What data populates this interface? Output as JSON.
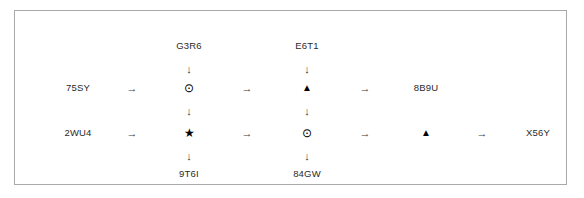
{
  "diagram": {
    "type": "flow-grid",
    "border_color": "#a9a9ad",
    "background": "#ffffff",
    "text_color": "#2a2a2a",
    "glyphs": {
      "arrow_right": "→",
      "arrow_down": "↓",
      "circled_dot": "⊙",
      "triangle_up": "▲",
      "star": "★"
    },
    "columns": {
      "col1_x": 63,
      "col2_x": 117,
      "col3_x": 174,
      "col4_x": 232,
      "col5_x": 292,
      "col6_x": 350,
      "col7_x": 411,
      "col8_x": 467,
      "col9_x": 523
    },
    "rows": {
      "top_label_y": 35,
      "top_arrow_y": 58,
      "row1_y": 77,
      "mid_arrow_y": 100,
      "row2_y": 122,
      "bottom_arrow_y": 145,
      "bottom_label_y": 163
    },
    "top_labels": [
      {
        "text": "G3R6",
        "col": "col3_x"
      },
      {
        "text": "E6T1",
        "col": "col5_x"
      }
    ],
    "bottom_labels": [
      {
        "text": "9T6I",
        "col": "col3_x"
      },
      {
        "text": "84GW",
        "col": "col5_x"
      }
    ],
    "row1": {
      "items": [
        {
          "kind": "label",
          "text": "75SY",
          "col": "col1_x"
        },
        {
          "kind": "arrow-right",
          "text": "→",
          "col": "col2_x"
        },
        {
          "kind": "node-circledot",
          "text": "⊙",
          "col": "col3_x"
        },
        {
          "kind": "arrow-right",
          "text": "→",
          "col": "col4_x"
        },
        {
          "kind": "node-triangle",
          "text": "▲",
          "col": "col5_x"
        },
        {
          "kind": "arrow-right",
          "text": "→",
          "col": "col6_x"
        },
        {
          "kind": "label",
          "text": "8B9U",
          "col": "col7_x"
        }
      ]
    },
    "row2": {
      "items": [
        {
          "kind": "label",
          "text": "2WU4",
          "col": "col1_x"
        },
        {
          "kind": "arrow-right",
          "text": "→",
          "col": "col2_x"
        },
        {
          "kind": "node-star",
          "text": "★",
          "col": "col3_x"
        },
        {
          "kind": "arrow-right",
          "text": "→",
          "col": "col4_x"
        },
        {
          "kind": "node-circledot",
          "text": "⊙",
          "col": "col5_x"
        },
        {
          "kind": "arrow-right",
          "text": "→",
          "col": "col6_x"
        },
        {
          "kind": "node-triangle",
          "text": "▲",
          "col": "col7_x"
        },
        {
          "kind": "arrow-right",
          "text": "→",
          "col": "col8_x"
        },
        {
          "kind": "label",
          "text": "X56Y",
          "col": "col9_x"
        }
      ]
    },
    "vertical_connectors": [
      {
        "text": "↓",
        "col": "col3_x",
        "row": "top_arrow_y"
      },
      {
        "text": "↓",
        "col": "col5_x",
        "row": "top_arrow_y"
      },
      {
        "text": "↓",
        "col": "col3_x",
        "row": "mid_arrow_y"
      },
      {
        "text": "↓",
        "col": "col5_x",
        "row": "mid_arrow_y"
      },
      {
        "text": "↓",
        "col": "col3_x",
        "row": "bottom_arrow_y"
      },
      {
        "text": "↓",
        "col": "col5_x",
        "row": "bottom_arrow_y"
      }
    ]
  }
}
